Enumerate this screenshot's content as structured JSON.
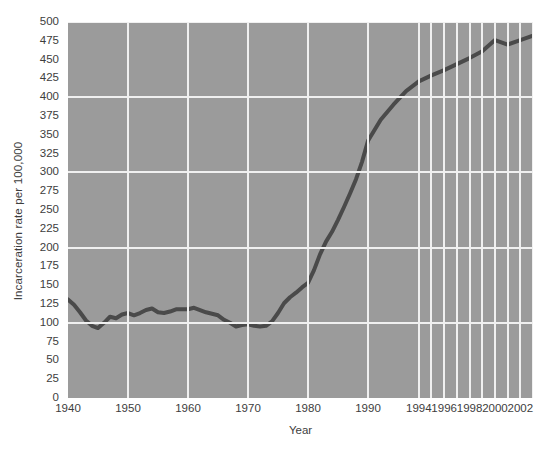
{
  "chart_data": {
    "type": "line",
    "title": "",
    "xlabel": "Year",
    "ylabel": "Incarceration rate per 100,000",
    "xlim": [
      1940,
      2003
    ],
    "ylim": [
      0,
      500
    ],
    "grid": true,
    "legend": null,
    "y_ticks": [
      0,
      25,
      50,
      75,
      100,
      125,
      150,
      175,
      200,
      225,
      250,
      275,
      300,
      325,
      350,
      375,
      400,
      425,
      450,
      475,
      500
    ],
    "y_gridlines": [
      100,
      200,
      300,
      400,
      500
    ],
    "x_ticks": [
      1940,
      1950,
      1960,
      1970,
      1980,
      1990,
      1994,
      1996,
      1998,
      2000,
      2002
    ],
    "x_gridlines": [
      1950,
      1960,
      1970,
      1980,
      1990,
      1994,
      1995,
      1996,
      1997,
      1998,
      1999,
      2000,
      2001,
      2002,
      2003
    ],
    "series": [
      {
        "name": "Incarceration rate",
        "x": [
          1940,
          1941,
          1942,
          1943,
          1944,
          1945,
          1946,
          1947,
          1948,
          1949,
          1950,
          1951,
          1952,
          1953,
          1954,
          1955,
          1956,
          1957,
          1958,
          1959,
          1960,
          1961,
          1962,
          1963,
          1964,
          1965,
          1966,
          1967,
          1968,
          1969,
          1970,
          1971,
          1972,
          1973,
          1974,
          1975,
          1976,
          1977,
          1978,
          1979,
          1980,
          1981,
          1982,
          1983,
          1984,
          1985,
          1986,
          1987,
          1988,
          1989,
          1990,
          1991,
          1992,
          1993,
          1994,
          1995,
          1996,
          1997,
          1998,
          1999,
          2000,
          2001,
          2002,
          2003
        ],
        "y": [
          131,
          124,
          114,
          103,
          96,
          93,
          100,
          108,
          106,
          111,
          113,
          110,
          113,
          117,
          119,
          114,
          113,
          115,
          118,
          118,
          118,
          120,
          117,
          114,
          112,
          110,
          104,
          100,
          95,
          97,
          98,
          96,
          95,
          96,
          102,
          113,
          126,
          134,
          140,
          147,
          153,
          170,
          191,
          208,
          221,
          237,
          254,
          272,
          291,
          314,
          342,
          370,
          390,
          408,
          421,
          429,
          436,
          444,
          452,
          461,
          476,
          470,
          476,
          482
        ]
      }
    ],
    "line_color": "#4a4a4a",
    "line_width": 4,
    "plot_bg_color": "#9b9b9b",
    "grid_color": "#f0f0f0",
    "figure_bg_color": "#ffffff"
  },
  "axes": {
    "y_title": "Incarceration rate per 100,000",
    "x_title": "Year",
    "y_tick_labels": [
      "500",
      "475",
      "450",
      "425",
      "400",
      "375",
      "350",
      "325",
      "300",
      "275",
      "250",
      "225",
      "200",
      "175",
      "150",
      "125",
      "100",
      "75",
      "50",
      "25",
      "0"
    ],
    "x_tick_labels": [
      "1940",
      "1950",
      "1960",
      "1970",
      "1980",
      "1990",
      "1994",
      "1996",
      "1998",
      "2000",
      "2002"
    ]
  },
  "caption": {
    "top_clipped_text": ""
  }
}
